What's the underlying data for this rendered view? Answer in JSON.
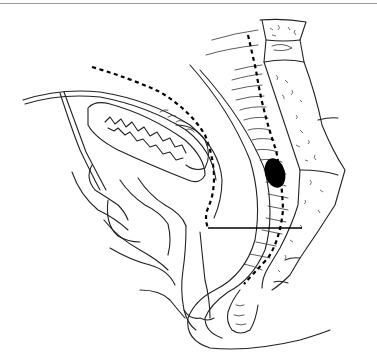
{
  "figure": {
    "type": "anatomical-line-drawing",
    "view": "sagittal-pelvis",
    "border_color": "#9a9a9a",
    "stroke_color": "#222222",
    "mass_color": "#000000",
    "background": "#ffffff"
  }
}
